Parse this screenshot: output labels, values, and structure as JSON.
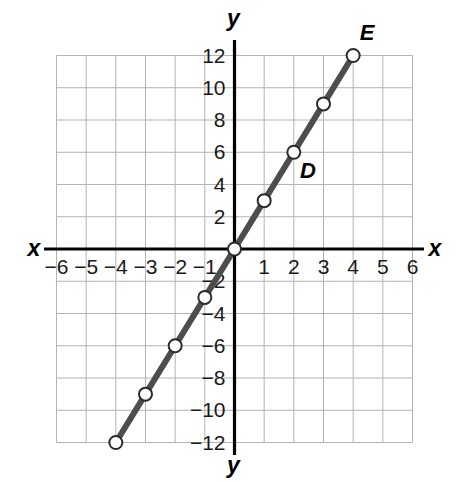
{
  "chart_data": {
    "type": "line",
    "title": "",
    "xlabel": "x",
    "ylabel": "y",
    "xlim": [
      -6,
      6
    ],
    "ylim": [
      -12,
      12
    ],
    "grid": true,
    "legend": "none",
    "x_ticks": [
      -6,
      -5,
      -4,
      -3,
      -2,
      -1,
      1,
      2,
      3,
      4,
      5,
      6
    ],
    "x_tick_labels": [
      "−6",
      "−5",
      "−4",
      "−3",
      "−2",
      "−1",
      "1",
      "2",
      "3",
      "4",
      "5",
      "6"
    ],
    "y_ticks": [
      12,
      10,
      8,
      6,
      4,
      2,
      -2,
      -4,
      -6,
      -8,
      -10,
      -12
    ],
    "y_tick_labels": [
      "12",
      "10",
      "8",
      "6",
      "4",
      "2",
      "−2",
      "−4",
      "−6",
      "−8",
      "−10",
      "−12"
    ],
    "x_grid_step": 1,
    "y_grid_step": 2,
    "series": [
      {
        "name": "line through origin, slope 3",
        "marker": "open-circle",
        "color": "#4d4d4d",
        "points": [
          {
            "x": -4,
            "y": -12,
            "label": ""
          },
          {
            "x": -3,
            "y": -9,
            "label": ""
          },
          {
            "x": -2,
            "y": -6,
            "label": ""
          },
          {
            "x": -1,
            "y": -3,
            "label": ""
          },
          {
            "x": 0,
            "y": 0,
            "label": ""
          },
          {
            "x": 1,
            "y": 3,
            "label": ""
          },
          {
            "x": 2,
            "y": 6,
            "label": "D"
          },
          {
            "x": 3,
            "y": 9,
            "label": ""
          },
          {
            "x": 4,
            "y": 12,
            "label": "E"
          }
        ]
      }
    ],
    "annotations": [
      {
        "text": "D",
        "x": 2,
        "y": 6,
        "placement": "below-right"
      },
      {
        "text": "E",
        "x": 4,
        "y": 12,
        "placement": "above"
      }
    ],
    "axis_labels": {
      "x_left": "x",
      "x_right": "x",
      "y_top": "y",
      "y_bottom": "y"
    }
  },
  "colors": {
    "line": "#4d4d4d",
    "axis": "#000000",
    "grid": "#b3b3b8",
    "marker_fill": "#ffffff",
    "marker_stroke": "#2b2b2b",
    "text": "#111111",
    "background": "#ffffff"
  }
}
